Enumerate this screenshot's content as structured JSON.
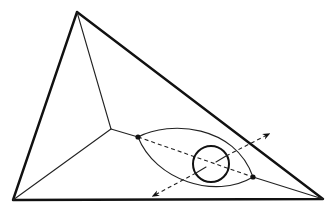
{
  "diagram": {
    "title": "",
    "colors": {
      "stroke": "#111111",
      "background": "#ffffff"
    },
    "elements": {
      "outer_triangle": "triangle",
      "interior_edges": [
        "apex-to-junction",
        "left-vertex-to-junction",
        "junction-to-left-node",
        "right-node-to-right-vertex"
      ],
      "lens": "lens-region",
      "circle": "circle",
      "dashed_axis": "dashed-line-between-nodes",
      "arrows": [
        "arrow-up-right",
        "arrow-down-left"
      ],
      "nodes": [
        "left-node",
        "right-node"
      ]
    }
  }
}
